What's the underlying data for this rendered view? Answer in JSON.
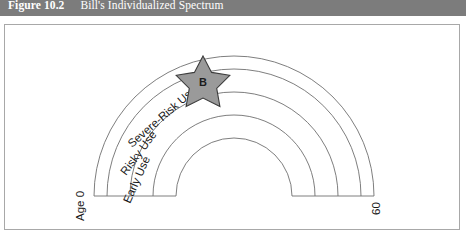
{
  "caption": {
    "number": "Figure 10.2",
    "title": "Bill's Individualized Spectrum"
  },
  "diagram": {
    "type": "arc-spectrum",
    "bands": [
      {
        "id": "early-use",
        "label": "Early Use"
      },
      {
        "id": "risky-use",
        "label": "Risky Use"
      },
      {
        "id": "severe-risk-use",
        "label": "Severe-Risk Use"
      },
      {
        "id": "outer-band",
        "label": ""
      }
    ],
    "axis": {
      "start_label": "Age 0",
      "end_label": "60"
    },
    "marker": {
      "id": "bill-marker",
      "letter": "B",
      "shape": "star",
      "fill": "#9a9a9a",
      "stroke": "#3c3c3c"
    },
    "colors": {
      "caption_bar": "#7c7c7c",
      "frame_border": "#a8a8a8",
      "arc_stroke": "#6f6f6f",
      "background": "#ffffff"
    }
  }
}
